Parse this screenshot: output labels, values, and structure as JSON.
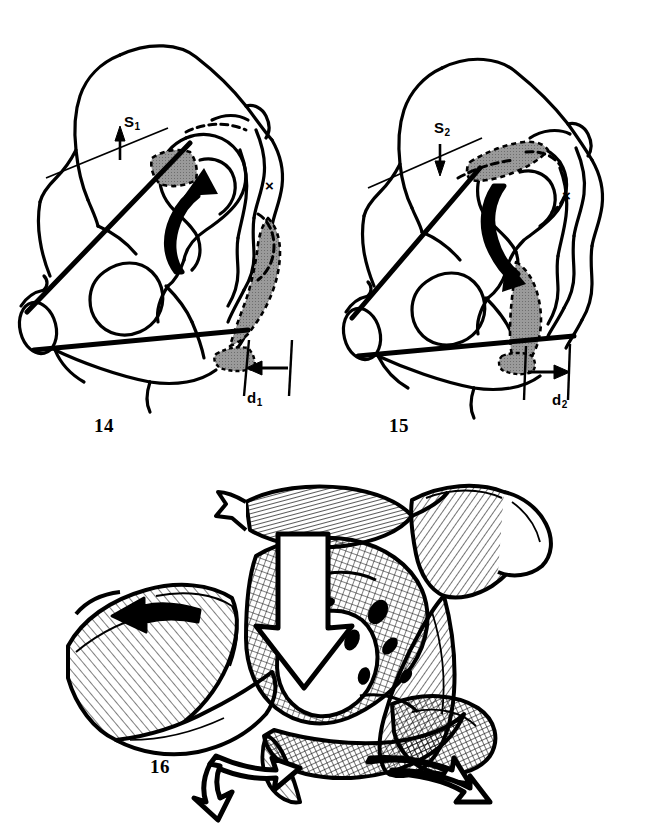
{
  "plate": {
    "kind": "anatomical-line-drawing-plate",
    "background_color": "#ffffff",
    "ink_color": "#000000",
    "shaded_region_color": "#9a9a9a",
    "figure_count": 3
  },
  "figures": [
    {
      "number": "14",
      "subject": "innominate bone lateral view, pre-osteotomy rotation",
      "rotation_arrow_direction": "up",
      "reference_point_marker": "×",
      "measurements": [
        {
          "symbol": "S",
          "subscript": "1",
          "display": "S1",
          "arrow_direction": "up-right"
        },
        {
          "symbol": "d",
          "subscript": "1",
          "display": "d1",
          "arrow_direction": "left"
        }
      ]
    },
    {
      "number": "15",
      "subject": "innominate bone lateral view, post-osteotomy rotation",
      "rotation_arrow_direction": "down",
      "reference_point_marker": "×",
      "measurements": [
        {
          "symbol": "S",
          "subscript": "2",
          "display": "S2",
          "arrow_direction": "down-left"
        },
        {
          "symbol": "d",
          "subscript": "2",
          "display": "d2",
          "arrow_direction": "right"
        }
      ]
    },
    {
      "number": "16",
      "subject": "pelvis anterior oblique view with muscle hatching and displacement arrows",
      "arrows": [
        {
          "name": "upper-left-solid-arrow",
          "direction": "left",
          "style": "solid-black"
        },
        {
          "name": "central-hollow-arrow",
          "direction": "down",
          "style": "white-outlined"
        },
        {
          "name": "lower-left-hollow-arrow",
          "direction": "down-left",
          "style": "white-outlined"
        },
        {
          "name": "lower-right-hollow-arrow",
          "direction": "right",
          "style": "white-outlined"
        }
      ]
    }
  ],
  "labels": {
    "s1": {
      "base": "S",
      "sub": "1"
    },
    "d1": {
      "base": "d",
      "sub": "1"
    },
    "s2": {
      "base": "S",
      "sub": "2"
    },
    "d2": {
      "base": "d",
      "sub": "2"
    },
    "cross": "×",
    "fig14": "14",
    "fig15": "15",
    "fig16": "16"
  }
}
